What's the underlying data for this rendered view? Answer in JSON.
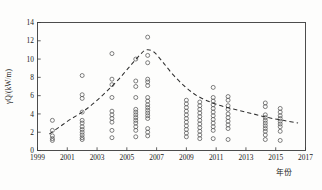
{
  "chart_data": {
    "type": "scatter",
    "title": "",
    "xlabel": "年份",
    "ylabel": "γQ/(kW/m)",
    "xlim": [
      1999,
      2017
    ],
    "ylim": [
      0,
      14
    ],
    "xticks": [
      1999,
      2001,
      2003,
      2005,
      2007,
      2009,
      2011,
      2013,
      2015,
      2017
    ],
    "yticks": [
      0,
      2,
      4,
      6,
      8,
      10,
      12,
      14
    ],
    "grid": false,
    "legend": null,
    "series": [
      {
        "name": "观测值",
        "marker": "open-circle",
        "points": [
          [
            2000.0,
            3.3
          ],
          [
            2000.0,
            2.2
          ],
          [
            2000.0,
            1.6
          ],
          [
            2000.0,
            1.3
          ],
          [
            2000.0,
            1.1
          ],
          [
            2002.0,
            8.2
          ],
          [
            2002.0,
            6.1
          ],
          [
            2002.0,
            5.7
          ],
          [
            2002.0,
            4.2
          ],
          [
            2002.0,
            3.3
          ],
          [
            2002.0,
            3.0
          ],
          [
            2002.0,
            2.6
          ],
          [
            2002.0,
            2.3
          ],
          [
            2002.0,
            2.0
          ],
          [
            2002.0,
            1.7
          ],
          [
            2002.0,
            1.4
          ],
          [
            2002.0,
            1.2
          ],
          [
            2004.0,
            10.6
          ],
          [
            2004.0,
            7.8
          ],
          [
            2004.0,
            7.2
          ],
          [
            2004.0,
            5.8
          ],
          [
            2004.0,
            4.3
          ],
          [
            2004.0,
            3.9
          ],
          [
            2004.0,
            3.5
          ],
          [
            2004.0,
            3.1
          ],
          [
            2004.0,
            2.2
          ],
          [
            2004.0,
            1.4
          ],
          [
            2005.6,
            10.0
          ],
          [
            2005.6,
            7.6
          ],
          [
            2005.6,
            7.0
          ],
          [
            2005.6,
            5.8
          ],
          [
            2005.6,
            4.5
          ],
          [
            2005.6,
            4.2
          ],
          [
            2005.6,
            3.9
          ],
          [
            2005.6,
            3.6
          ],
          [
            2005.6,
            3.3
          ],
          [
            2005.6,
            3.0
          ],
          [
            2005.6,
            2.6
          ],
          [
            2005.6,
            2.2
          ],
          [
            2005.6,
            1.5
          ],
          [
            2006.4,
            12.4
          ],
          [
            2006.4,
            10.4
          ],
          [
            2006.4,
            9.6
          ],
          [
            2006.4,
            7.8
          ],
          [
            2006.4,
            7.5
          ],
          [
            2006.4,
            7.1
          ],
          [
            2006.4,
            5.8
          ],
          [
            2006.4,
            5.4
          ],
          [
            2006.4,
            5.0
          ],
          [
            2006.4,
            4.7
          ],
          [
            2006.4,
            4.4
          ],
          [
            2006.4,
            4.1
          ],
          [
            2006.4,
            3.8
          ],
          [
            2006.4,
            3.5
          ],
          [
            2006.4,
            2.4
          ],
          [
            2006.4,
            2.0
          ],
          [
            2006.4,
            1.6
          ],
          [
            2009.0,
            5.5
          ],
          [
            2009.0,
            5.1
          ],
          [
            2009.0,
            4.7
          ],
          [
            2009.0,
            4.3
          ],
          [
            2009.0,
            3.9
          ],
          [
            2009.0,
            3.5
          ],
          [
            2009.0,
            3.1
          ],
          [
            2009.0,
            2.7
          ],
          [
            2009.0,
            2.3
          ],
          [
            2009.0,
            1.9
          ],
          [
            2009.0,
            1.5
          ],
          [
            2009.9,
            5.3
          ],
          [
            2009.9,
            4.9
          ],
          [
            2009.9,
            4.5
          ],
          [
            2009.9,
            4.1
          ],
          [
            2009.9,
            3.7
          ],
          [
            2009.9,
            3.3
          ],
          [
            2009.9,
            2.9
          ],
          [
            2009.9,
            2.5
          ],
          [
            2009.9,
            2.1
          ],
          [
            2009.9,
            1.7
          ],
          [
            2009.9,
            1.3
          ],
          [
            2010.8,
            6.9
          ],
          [
            2010.8,
            5.8
          ],
          [
            2010.8,
            5.4
          ],
          [
            2010.8,
            5.0
          ],
          [
            2010.8,
            4.6
          ],
          [
            2010.8,
            4.2
          ],
          [
            2010.8,
            3.8
          ],
          [
            2010.8,
            3.4
          ],
          [
            2010.8,
            3.0
          ],
          [
            2010.8,
            2.6
          ],
          [
            2010.8,
            2.2
          ],
          [
            2010.8,
            1.3
          ],
          [
            2011.8,
            5.9
          ],
          [
            2011.8,
            5.5
          ],
          [
            2011.8,
            4.9
          ],
          [
            2011.8,
            4.5
          ],
          [
            2011.8,
            4.0
          ],
          [
            2011.8,
            3.6
          ],
          [
            2011.8,
            3.2
          ],
          [
            2011.8,
            2.8
          ],
          [
            2011.8,
            2.4
          ],
          [
            2011.8,
            1.2
          ],
          [
            2014.3,
            5.2
          ],
          [
            2014.3,
            4.8
          ],
          [
            2014.3,
            3.9
          ],
          [
            2014.3,
            3.6
          ],
          [
            2014.3,
            3.3
          ],
          [
            2014.3,
            3.0
          ],
          [
            2014.3,
            2.7
          ],
          [
            2014.3,
            2.4
          ],
          [
            2014.3,
            2.1
          ],
          [
            2014.3,
            1.7
          ],
          [
            2014.3,
            1.2
          ],
          [
            2015.3,
            4.6
          ],
          [
            2015.3,
            4.2
          ],
          [
            2015.3,
            3.8
          ],
          [
            2015.3,
            3.5
          ],
          [
            2015.3,
            3.2
          ],
          [
            2015.3,
            2.9
          ],
          [
            2015.3,
            2.6
          ],
          [
            2015.3,
            2.1
          ],
          [
            2015.3,
            1.1
          ]
        ]
      }
    ],
    "trend": {
      "name": "趋势线",
      "style": "dashed",
      "points": [
        [
          1999.8,
          1.8
        ],
        [
          2000.5,
          2.6
        ],
        [
          2001.2,
          3.4
        ],
        [
          2002.0,
          4.2
        ],
        [
          2002.8,
          5.2
        ],
        [
          2003.6,
          6.4
        ],
        [
          2004.4,
          7.7
        ],
        [
          2005.2,
          9.2
        ],
        [
          2005.9,
          10.5
        ],
        [
          2006.3,
          11.0
        ],
        [
          2006.8,
          10.8
        ],
        [
          2007.4,
          9.7
        ],
        [
          2008.1,
          8.3
        ],
        [
          2008.9,
          7.0
        ],
        [
          2009.7,
          6.0
        ],
        [
          2010.6,
          5.3
        ],
        [
          2011.5,
          4.8
        ],
        [
          2012.5,
          4.4
        ],
        [
          2013.5,
          4.0
        ],
        [
          2014.5,
          3.6
        ],
        [
          2015.5,
          3.3
        ],
        [
          2016.5,
          3.0
        ]
      ]
    }
  }
}
